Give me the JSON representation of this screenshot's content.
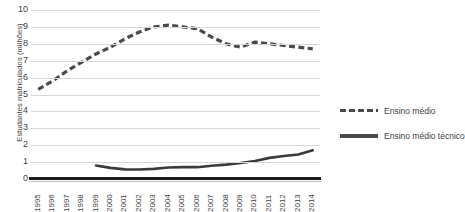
{
  "chart_data": {
    "type": "line",
    "title": "",
    "xlabel": "",
    "ylabel": "Estudantes matriculados (milhões)",
    "ylim": [
      0,
      10
    ],
    "ytick_step": 1,
    "yticks": [
      "10",
      "9",
      "8",
      "7",
      "6",
      "5",
      "4",
      "3",
      "2",
      "1",
      "0"
    ],
    "grid": true,
    "legend_position": "right",
    "x": [
      "1995",
      "1996",
      "1997",
      "1998",
      "1999",
      "2000",
      "2001",
      "2002",
      "2003",
      "2004",
      "2005",
      "2006",
      "2007",
      "2008",
      "2009",
      "2010",
      "2011",
      "2012",
      "2013",
      "2014"
    ],
    "series": [
      {
        "name": "Ensino médio",
        "style": "dashed",
        "color": "#4a4a4a",
        "values": [
          5.3,
          5.8,
          6.4,
          6.9,
          7.4,
          7.8,
          8.3,
          8.7,
          9.0,
          9.1,
          9.0,
          8.9,
          8.4,
          8.0,
          7.8,
          8.1,
          8.0,
          7.9,
          7.8,
          7.7
        ]
      },
      {
        "name": "Ensino médio técnico",
        "style": "solid",
        "color": "#3a3a3a",
        "values": [
          null,
          null,
          null,
          null,
          0.8,
          0.66,
          0.57,
          0.56,
          0.6,
          0.68,
          0.7,
          0.7,
          0.78,
          0.85,
          0.95,
          1.07,
          1.25,
          1.36,
          1.45,
          1.7
        ]
      }
    ]
  },
  "legend": {
    "items": [
      {
        "label": "Ensino médio",
        "style": "dashed"
      },
      {
        "label": "Ensino médio técnico",
        "style": "solid"
      }
    ]
  }
}
